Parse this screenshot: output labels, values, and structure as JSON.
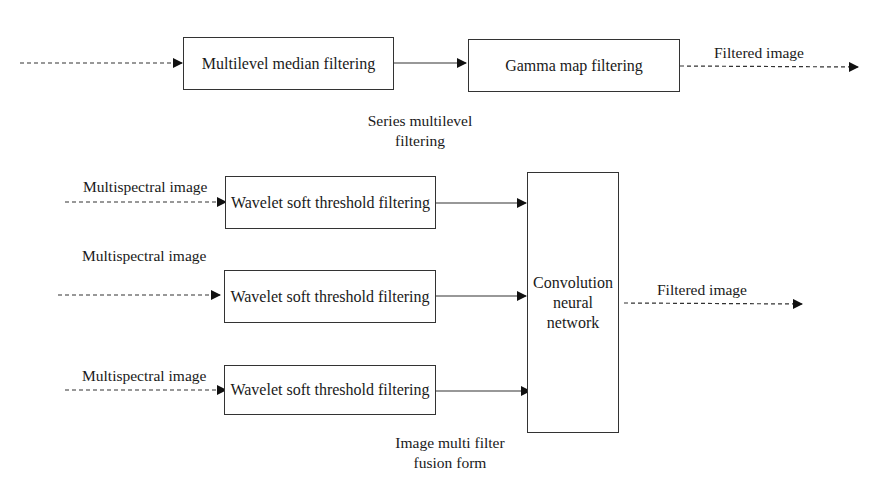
{
  "diagram": {
    "series_section": {
      "caption": [
        "Series multilevel",
        "filtering"
      ],
      "boxes": [
        {
          "id": "median",
          "label": "Multilevel median filtering"
        },
        {
          "id": "gamma",
          "label": "Gamma map filtering"
        }
      ],
      "output_label": "Filtered image"
    },
    "fusion_section": {
      "caption": [
        "Image multi filter",
        "fusion form"
      ],
      "inputs": [
        {
          "input_label": "Multispectral image",
          "box_label": "Wavelet soft threshold filtering"
        },
        {
          "input_label": "Multispectral image",
          "box_label": "Wavelet soft threshold filtering"
        },
        {
          "input_label": "Multispectral image",
          "box_label": "Wavelet soft threshold filtering"
        }
      ],
      "cnn_box": [
        "Convolution",
        "neural",
        "network"
      ],
      "output_label": "Filtered image"
    },
    "edges": [
      {
        "from": "input",
        "to": "median",
        "style": "dashed"
      },
      {
        "from": "median",
        "to": "gamma",
        "style": "solid"
      },
      {
        "from": "gamma",
        "to": "output",
        "style": "dashed"
      },
      {
        "from": "input1",
        "to": "wavelet1",
        "style": "dashed"
      },
      {
        "from": "input2",
        "to": "wavelet2",
        "style": "dashed"
      },
      {
        "from": "input3",
        "to": "wavelet3",
        "style": "dashed"
      },
      {
        "from": "wavelet1",
        "to": "cnn",
        "style": "solid"
      },
      {
        "from": "wavelet2",
        "to": "cnn",
        "style": "solid"
      },
      {
        "from": "wavelet3",
        "to": "cnn",
        "style": "solid"
      },
      {
        "from": "cnn",
        "to": "output",
        "style": "dashed"
      }
    ]
  }
}
